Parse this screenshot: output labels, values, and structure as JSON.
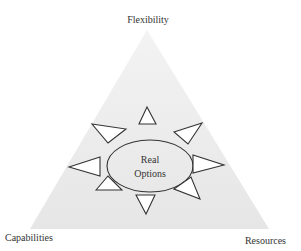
{
  "diagram": {
    "type": "triangle-with-central-ellipse",
    "vertices": {
      "top": "Flexibility",
      "bottom_left": "Capabilities",
      "bottom_right": "Resources"
    },
    "center": {
      "line1": "Real",
      "line2": "Options"
    },
    "colors": {
      "triangle_fill": "#ececec",
      "stroke": "#333333",
      "text": "#333333",
      "background": "#ffffff"
    },
    "ray_count": 8
  }
}
